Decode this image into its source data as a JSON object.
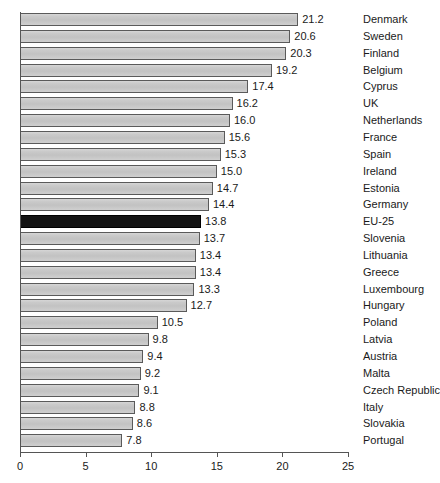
{
  "chart_data": {
    "type": "bar",
    "orientation": "horizontal",
    "title": "",
    "subtitle": "",
    "xlabel": "",
    "ylabel": "",
    "xlim": [
      0,
      25
    ],
    "xticks": [
      0,
      5,
      10,
      15,
      20,
      25
    ],
    "xtick_labels": [
      "0",
      "5",
      "10",
      "15",
      "20",
      "25"
    ],
    "grid": false,
    "legend": null,
    "value_label_format": "one decimal",
    "highlight_category": "EU-25",
    "colors": {
      "bar_fill": "#c8c8c8",
      "bar_border": "#5a5a5a",
      "highlight_fill": "#141414",
      "axis": "#555555",
      "text": "#1a1a1a",
      "background": "#ffffff"
    },
    "categories": [
      "Denmark",
      "Sweden",
      "Finland",
      "Belgium",
      "Cyprus",
      "UK",
      "Netherlands",
      "France",
      "Spain",
      "Ireland",
      "Estonia",
      "Germany",
      "EU-25",
      "Slovenia",
      "Lithuania",
      "Greece",
      "Luxembourg",
      "Hungary",
      "Poland",
      "Latvia",
      "Austria",
      "Malta",
      "Czech Republic",
      "Italy",
      "Slovakia",
      "Portugal"
    ],
    "values": [
      21.2,
      20.6,
      20.3,
      19.2,
      17.4,
      16.2,
      16.0,
      15.6,
      15.3,
      15.0,
      14.7,
      14.4,
      13.8,
      13.7,
      13.4,
      13.4,
      13.3,
      12.7,
      10.5,
      9.8,
      9.4,
      9.2,
      9.1,
      8.8,
      8.6,
      7.8
    ],
    "value_labels": [
      "21.2",
      "20.6",
      "20.3",
      "19.2",
      "17.4",
      "16.2",
      "16.0",
      "15.6",
      "15.3",
      "15.0",
      "14.7",
      "14.4",
      "13.8",
      "13.7",
      "13.4",
      "13.4",
      "13.3",
      "12.7",
      "10.5",
      "9.8",
      "9.4",
      "9.2",
      "9.1",
      "8.8",
      "8.6",
      "7.8"
    ]
  }
}
